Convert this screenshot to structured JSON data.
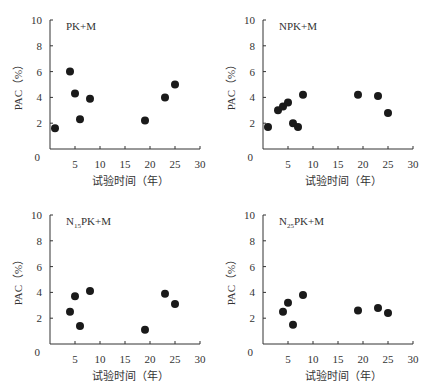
{
  "chart_data": [
    {
      "type": "scatter",
      "title": "PK+M",
      "xlabel": "试验时间（年）",
      "ylabel": "PAC（%）",
      "xlim": [
        0,
        30
      ],
      "ylim": [
        0,
        10
      ],
      "xticks": [
        5,
        10,
        15,
        20,
        25,
        30
      ],
      "yticks": [
        0,
        2,
        4,
        6,
        8,
        10
      ],
      "grid": false,
      "points": [
        [
          1,
          1.6
        ],
        [
          4,
          6.0
        ],
        [
          5,
          4.3
        ],
        [
          6,
          2.3
        ],
        [
          8,
          3.9
        ],
        [
          19,
          2.2
        ],
        [
          23,
          4.0
        ],
        [
          25,
          5.0
        ]
      ]
    },
    {
      "type": "scatter",
      "title": "NPK+M",
      "xlabel": "试验时间（年）",
      "ylabel": "PAC（%）",
      "xlim": [
        0,
        30
      ],
      "ylim": [
        0,
        10
      ],
      "xticks": [
        5,
        10,
        15,
        20,
        25,
        30
      ],
      "yticks": [
        0,
        2,
        4,
        6,
        8,
        10
      ],
      "grid": false,
      "points": [
        [
          1,
          1.7
        ],
        [
          3,
          3.0
        ],
        [
          4,
          3.3
        ],
        [
          5,
          3.6
        ],
        [
          6,
          2.0
        ],
        [
          7,
          1.7
        ],
        [
          8,
          4.2
        ],
        [
          19,
          4.2
        ],
        [
          23,
          4.1
        ],
        [
          25,
          2.8
        ]
      ]
    },
    {
      "type": "scatter",
      "title": "N15PK+M",
      "title_main": "N",
      "title_sub": "15",
      "title_rest": "PK+M",
      "xlabel": "试验时间（年）",
      "ylabel": "PAC（%）",
      "xlim": [
        0,
        30
      ],
      "ylim": [
        0,
        10
      ],
      "xticks": [
        5,
        10,
        15,
        20,
        25,
        30
      ],
      "yticks": [
        0,
        2,
        4,
        6,
        8,
        10
      ],
      "grid": false,
      "points": [
        [
          4,
          2.5
        ],
        [
          5,
          3.7
        ],
        [
          6,
          1.4
        ],
        [
          8,
          4.1
        ],
        [
          19,
          1.1
        ],
        [
          23,
          3.9
        ],
        [
          25,
          3.1
        ]
      ]
    },
    {
      "type": "scatter",
      "title": "N25PK+M",
      "title_main": "N",
      "title_sub": "25",
      "title_rest": "PK+M",
      "xlabel": "试验时间（年）",
      "ylabel": "PAC（%）",
      "xlim": [
        0,
        30
      ],
      "ylim": [
        0,
        10
      ],
      "xticks": [
        5,
        10,
        15,
        20,
        25,
        30
      ],
      "yticks": [
        0,
        2,
        4,
        6,
        8,
        10
      ],
      "grid": false,
      "points": [
        [
          4,
          2.5
        ],
        [
          5,
          3.2
        ],
        [
          6,
          1.5
        ],
        [
          8,
          3.8
        ],
        [
          19,
          2.6
        ],
        [
          23,
          2.8
        ],
        [
          25,
          2.4
        ]
      ]
    }
  ],
  "style": {
    "marker_color": "#1a1a1a",
    "axis_color": "#333333"
  }
}
